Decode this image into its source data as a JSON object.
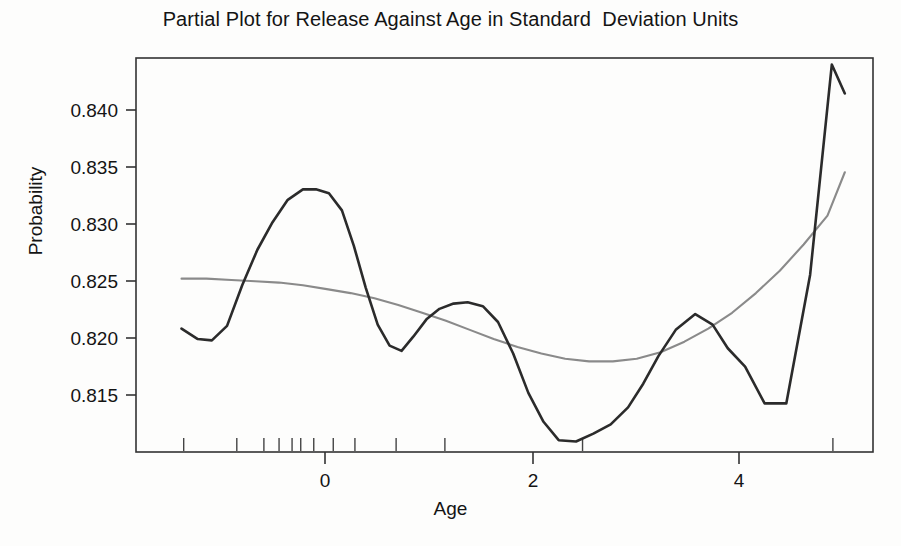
{
  "figure": {
    "title": "Partial Plot for Release Against Age in Standard  Deviation Units",
    "background_color": "#fdfdfc"
  },
  "axes": {
    "y_title": "Probability",
    "x_title": "Age",
    "y_ticks": [
      "0.840",
      "0.835",
      "0.830",
      "0.825",
      "0.820",
      "0.815"
    ],
    "x_ticks": [
      "0",
      "2",
      "4"
    ]
  },
  "chart_data": {
    "type": "line",
    "title": "Partial Plot for Release Against Age in Standard  Deviation Units",
    "xlabel": "Age",
    "ylabel": "Probability",
    "xlim": [
      -1.6,
      5.2
    ],
    "ylim": [
      0.8125,
      0.8425
    ],
    "grid": false,
    "legend": "none",
    "x_tick_values": [
      0,
      2,
      4
    ],
    "y_tick_values": [
      0.815,
      0.82,
      0.825,
      0.83,
      0.835,
      0.84
    ],
    "colors": {
      "partial_residual_curve": "#2b2b2b",
      "smooth_fit_curve": "#8a8a8a",
      "frame": "#333333"
    },
    "series": [
      {
        "name": "partial-residual-curve",
        "color": "#2b2b2b",
        "x": [
          -1.18,
          -1.03,
          -0.9,
          -0.76,
          -0.62,
          -0.48,
          -0.34,
          -0.2,
          -0.06,
          0.06,
          0.18,
          0.3,
          0.41,
          0.52,
          0.63,
          0.74,
          0.85,
          0.96,
          1.08,
          1.2,
          1.33,
          1.46,
          1.6,
          1.74,
          1.88,
          2.02,
          2.16,
          2.3,
          2.46,
          2.62,
          2.78,
          2.94,
          3.08,
          3.22,
          3.38,
          3.56,
          3.72,
          3.86,
          4.02,
          4.2,
          4.4,
          4.62,
          4.82,
          4.94
        ],
        "y": [
          0.8219,
          0.8211,
          0.821,
          0.8221,
          0.8252,
          0.8279,
          0.83,
          0.8317,
          0.8325,
          0.8325,
          0.8322,
          0.8309,
          0.8282,
          0.825,
          0.8222,
          0.8206,
          0.8202,
          0.8213,
          0.8226,
          0.8234,
          0.8238,
          0.8239,
          0.8236,
          0.8224,
          0.82,
          0.817,
          0.8148,
          0.8134,
          0.8133,
          0.8139,
          0.8146,
          0.8159,
          0.8177,
          0.8198,
          0.8218,
          0.823,
          0.8222,
          0.8204,
          0.819,
          0.8162,
          0.8162,
          0.826,
          0.842,
          0.8398
        ]
      },
      {
        "name": "smooth-fit-curve",
        "color": "#8a8a8a",
        "x": [
          -1.18,
          -0.95,
          -0.72,
          -0.5,
          -0.28,
          -0.06,
          0.16,
          0.38,
          0.6,
          0.82,
          1.04,
          1.26,
          1.48,
          1.7,
          1.92,
          2.14,
          2.36,
          2.58,
          2.8,
          3.02,
          3.24,
          3.46,
          3.68,
          3.9,
          4.12,
          4.34,
          4.56,
          4.78,
          4.94
        ],
        "y": [
          0.8257,
          0.8257,
          0.8256,
          0.8255,
          0.8254,
          0.8252,
          0.8249,
          0.8246,
          0.8242,
          0.8237,
          0.8231,
          0.8225,
          0.8218,
          0.8211,
          0.8205,
          0.82,
          0.8196,
          0.8194,
          0.8194,
          0.8196,
          0.8201,
          0.8209,
          0.8219,
          0.8231,
          0.8246,
          0.8263,
          0.8283,
          0.8305,
          0.8338
        ]
      }
    ],
    "rug_marks": {
      "name": "data-density-rug",
      "x": [
        -1.16,
        -0.67,
        -0.42,
        -0.28,
        -0.16,
        -0.08,
        0.04,
        0.22,
        0.42,
        0.8,
        1.25,
        2.52,
        4.83
      ]
    }
  }
}
